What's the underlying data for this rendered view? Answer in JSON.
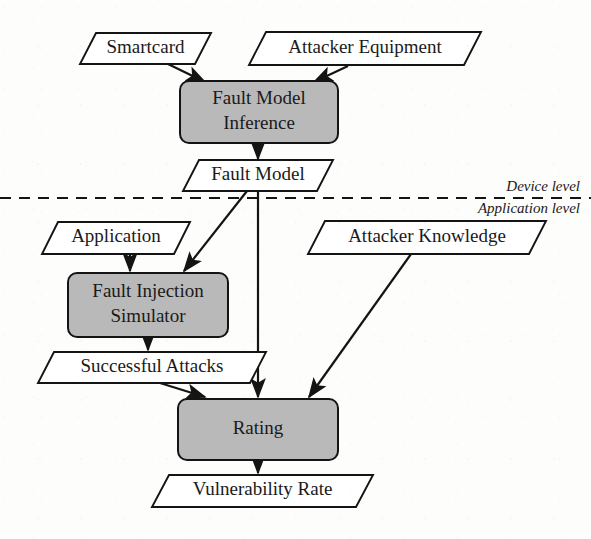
{
  "diagram": {
    "canvas": {
      "width": 591,
      "height": 539
    },
    "colors": {
      "process_fill": "#b9b9b9",
      "io_fill": "#ffffff",
      "stroke": "#141414",
      "background": "#fdfdfc",
      "text": "#1a1a1a"
    },
    "nodes": [
      {
        "id": "smartcard",
        "label": "Smartcard",
        "kind": "io",
        "shape": "parallelogram",
        "x": 80,
        "y": 33,
        "w": 131,
        "h": 31,
        "skew": 16,
        "font_size": 19
      },
      {
        "id": "attacker_equipment",
        "label": "Attacker Equipment",
        "kind": "io",
        "shape": "parallelogram",
        "x": 249,
        "y": 32,
        "w": 232,
        "h": 33,
        "skew": 17,
        "font_size": 19
      },
      {
        "id": "fault_model_inference",
        "label": "Fault Model Inference",
        "label_lines": [
          "Fault Model",
          "Inference"
        ],
        "kind": "process",
        "shape": "rounded-rect",
        "x": 180,
        "y": 81,
        "w": 158,
        "h": 62,
        "font_size": 19
      },
      {
        "id": "fault_model",
        "label": "Fault Model",
        "kind": "io",
        "shape": "parallelogram",
        "x": 183,
        "y": 160,
        "w": 150,
        "h": 31,
        "skew": 16,
        "font_size": 19
      },
      {
        "id": "application",
        "label": "Application",
        "kind": "io",
        "shape": "parallelogram",
        "x": 42,
        "y": 222,
        "w": 148,
        "h": 32,
        "skew": 16,
        "font_size": 19
      },
      {
        "id": "attacker_knowledge",
        "label": "Attacker Knowledge",
        "kind": "io",
        "shape": "parallelogram",
        "x": 308,
        "y": 221,
        "w": 238,
        "h": 33,
        "skew": 17,
        "font_size": 19
      },
      {
        "id": "fault_injection_simulator",
        "label": "Fault Injection Simulator",
        "label_lines": [
          "Fault Injection",
          "Simulator"
        ],
        "kind": "process",
        "shape": "rounded-rect",
        "x": 68,
        "y": 273,
        "w": 160,
        "h": 64,
        "font_size": 19
      },
      {
        "id": "successful_attacks",
        "label": "Successful Attacks",
        "kind": "io",
        "shape": "parallelogram",
        "x": 38,
        "y": 352,
        "w": 228,
        "h": 31,
        "skew": 16,
        "font_size": 19
      },
      {
        "id": "rating",
        "label": "Rating",
        "label_lines": [
          "Rating"
        ],
        "kind": "process",
        "shape": "rounded-rect",
        "x": 178,
        "y": 399,
        "w": 160,
        "h": 61,
        "font_size": 19
      },
      {
        "id": "vulnerability_rate",
        "label": "Vulnerability Rate",
        "kind": "io",
        "shape": "parallelogram",
        "x": 152,
        "y": 475,
        "w": 221,
        "h": 32,
        "skew": 17,
        "font_size": 19
      }
    ],
    "edges": [
      {
        "id": "smartcard-to-inference",
        "from": "smartcard",
        "to": "fault_model_inference",
        "path": "M 168,64 L 205,82",
        "arrow": true
      },
      {
        "id": "equipment-to-inference",
        "from": "attacker_equipment",
        "to": "fault_model_inference",
        "path": "M 348,66 L 314,82",
        "arrow": true
      },
      {
        "id": "inference-to-fault-model",
        "from": "fault_model_inference",
        "to": "fault_model",
        "path": "M 258,143 L 258,159",
        "arrow": true
      },
      {
        "id": "fault-model-to-simulator",
        "from": "fault_model",
        "to": "fault_injection_simulator",
        "path": "M 247,191 L 184,271",
        "arrow": true
      },
      {
        "id": "fault-model-to-rating",
        "from": "fault_model",
        "to": "rating",
        "path": "M 258,191 L 258,397",
        "arrow": true
      },
      {
        "id": "application-to-simulator",
        "from": "application",
        "to": "fault_injection_simulator",
        "path": "M 130,254 L 130,271",
        "arrow": true
      },
      {
        "id": "simulator-to-successful-attacks",
        "from": "fault_injection_simulator",
        "to": "successful_attacks",
        "path": "M 148,337 L 148,350",
        "arrow": true
      },
      {
        "id": "successful-attacks-to-rating",
        "from": "successful_attacks",
        "to": "rating",
        "path": "M 160,383 L 205,397",
        "arrow": true
      },
      {
        "id": "knowledge-to-rating",
        "from": "attacker_knowledge",
        "to": "rating",
        "path": "M 411,254 L 309,397",
        "arrow": true
      },
      {
        "id": "rating-to-vulnerability-rate",
        "from": "rating",
        "to": "vulnerability_rate",
        "path": "M 258,460 L 258,473",
        "arrow": true
      }
    ],
    "divider": {
      "id": "level-divider",
      "y": 198,
      "x1": 0,
      "x2": 591,
      "label_above": "Device level",
      "label_below": "Application level",
      "label_x": 580,
      "label_above_y": 191,
      "label_below_y": 213,
      "font_size": 15
    }
  }
}
